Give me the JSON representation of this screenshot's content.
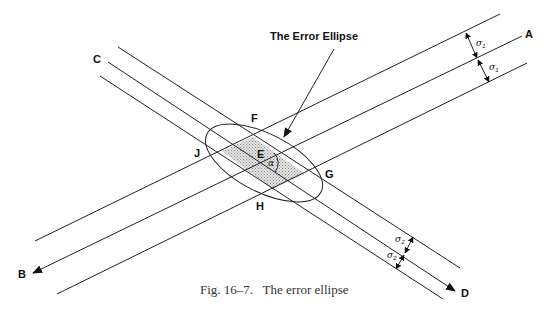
{
  "figure": {
    "title_label": "The Error Ellipse",
    "caption": "Fig. 16–7.   The error ellipse",
    "points": {
      "A": "A",
      "B": "B",
      "C": "C",
      "D": "D",
      "E": "E",
      "F": "F",
      "G": "G",
      "H": "H",
      "J": "J"
    },
    "angle_label": "α",
    "sigma1": {
      "symbol": "σ",
      "sub": "1"
    },
    "sigma2": {
      "symbol": "σ",
      "sub": "2"
    }
  }
}
